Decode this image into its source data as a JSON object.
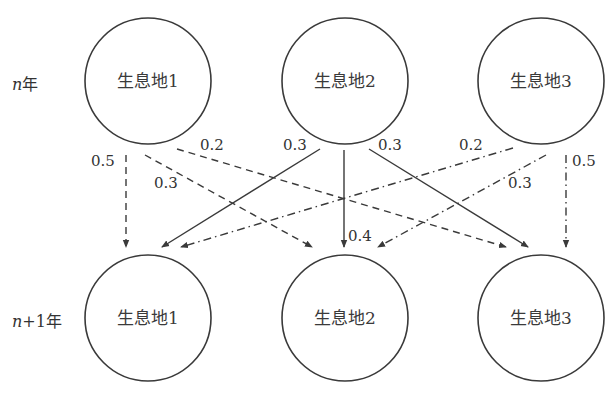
{
  "diagram": {
    "type": "transition-network",
    "rows": [
      {
        "id": "top",
        "label_var": "n",
        "label_suffix": "年",
        "y": 81
      },
      {
        "id": "bottom",
        "label_var": "n",
        "label_suffix": "+1年",
        "y": 318
      }
    ],
    "nodes": [
      {
        "id": "t1",
        "row": "top",
        "label": "生息地1",
        "cx": 148,
        "cy": 81,
        "r": 63
      },
      {
        "id": "t2",
        "row": "top",
        "label": "生息地2",
        "cx": 345,
        "cy": 81,
        "r": 63
      },
      {
        "id": "t3",
        "row": "top",
        "label": "生息地3",
        "cx": 541,
        "cy": 81,
        "r": 63
      },
      {
        "id": "b1",
        "row": "bottom",
        "label": "生息地1",
        "cx": 148,
        "cy": 318,
        "r": 63
      },
      {
        "id": "b2",
        "row": "bottom",
        "label": "生息地2",
        "cx": 345,
        "cy": 318,
        "r": 63
      },
      {
        "id": "b3",
        "row": "bottom",
        "label": "生息地3",
        "cx": 541,
        "cy": 318,
        "r": 63
      }
    ],
    "edges": [
      {
        "from": "t1",
        "to": "b1",
        "style": "dashed",
        "value": "0.5",
        "x1": 126,
        "y1": 155,
        "x2": 126,
        "y2": 247,
        "lx": 91,
        "ly": 161
      },
      {
        "from": "t1",
        "to": "b2",
        "style": "dashed",
        "value": "0.3",
        "x1": 145,
        "y1": 155,
        "x2": 312,
        "y2": 247,
        "lx": 154,
        "ly": 183
      },
      {
        "from": "t1",
        "to": "b3",
        "style": "dashed",
        "value": "0.2",
        "x1": 177,
        "y1": 149,
        "x2": 506,
        "y2": 247,
        "lx": 200,
        "ly": 145
      },
      {
        "from": "t2",
        "to": "b1",
        "style": "solid",
        "value": "0.3",
        "x1": 320,
        "y1": 149,
        "x2": 162,
        "y2": 247,
        "lx": 283,
        "ly": 145
      },
      {
        "from": "t2",
        "to": "b2",
        "style": "solid",
        "value": "0.4",
        "x1": 344,
        "y1": 150,
        "x2": 344,
        "y2": 247,
        "lx": 348,
        "ly": 236
      },
      {
        "from": "t2",
        "to": "b3",
        "style": "solid",
        "value": "0.3",
        "x1": 369,
        "y1": 149,
        "x2": 528,
        "y2": 247,
        "lx": 378,
        "ly": 145
      },
      {
        "from": "t3",
        "to": "b1",
        "style": "dashdot",
        "value": "0.2",
        "x1": 513,
        "y1": 148,
        "x2": 181,
        "y2": 247,
        "lx": 459,
        "ly": 145
      },
      {
        "from": "t3",
        "to": "b2",
        "style": "dashdot",
        "value": "0.3",
        "x1": 546,
        "y1": 155,
        "x2": 378,
        "y2": 247,
        "lx": 508,
        "ly": 183
      },
      {
        "from": "t3",
        "to": "b3",
        "style": "dashdot",
        "value": "0.5",
        "x1": 566,
        "y1": 155,
        "x2": 566,
        "y2": 247,
        "lx": 572,
        "ly": 161
      }
    ],
    "legend_styles": {
      "solid": "from 生息地2",
      "dashed": "from 生息地1",
      "dashdot": "from 生息地3"
    }
  },
  "labels": {
    "row_top_var": "n",
    "row_top_suffix": "年",
    "row_bottom_var": "n",
    "row_bottom_suffix": "+1年",
    "t1": "生息地1",
    "t2": "生息地2",
    "t3": "生息地3",
    "b1": "生息地1",
    "b2": "生息地2",
    "b3": "生息地3",
    "e_t1_b1": "0.5",
    "e_t1_b2": "0.3",
    "e_t1_b3": "0.2",
    "e_t2_b1": "0.3",
    "e_t2_b2": "0.4",
    "e_t2_b3": "0.3",
    "e_t3_b1": "0.2",
    "e_t3_b2": "0.3",
    "e_t3_b3": "0.5"
  },
  "colors": {
    "stroke": "#3a3a3a",
    "text": "#333333",
    "background": "#ffffff"
  }
}
